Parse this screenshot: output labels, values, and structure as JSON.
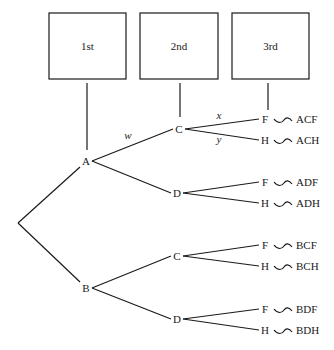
{
  "stages": [
    {
      "label": "1st",
      "x": 49,
      "y": 13,
      "w": 77,
      "h": 66,
      "lineX": 87,
      "lineY2": 150
    },
    {
      "label": "2nd",
      "x": 140,
      "y": 13,
      "w": 78,
      "h": 66,
      "lineX": 180,
      "lineY2": 117
    },
    {
      "label": "3rd",
      "x": 232,
      "y": 13,
      "w": 77,
      "h": 66,
      "lineX": 268,
      "lineY2": 110
    }
  ],
  "root": {
    "x": 18,
    "y": 223
  },
  "level1": [
    {
      "label": "A",
      "x": 86,
      "y": 161
    },
    {
      "label": "B",
      "x": 86,
      "y": 288
    }
  ],
  "level2": [
    {
      "label": "C",
      "parent": 0,
      "x": 179,
      "y": 129
    },
    {
      "label": "D",
      "parent": 0,
      "x": 177,
      "y": 193
    },
    {
      "label": "C",
      "parent": 1,
      "x": 177,
      "y": 256
    },
    {
      "label": "D",
      "parent": 1,
      "x": 177,
      "y": 319
    }
  ],
  "level3": [
    {
      "label": "F",
      "parent": 0,
      "x": 265,
      "y": 119,
      "outcome": "ACF"
    },
    {
      "label": "H",
      "parent": 0,
      "x": 265,
      "y": 140,
      "outcome": "ACH"
    },
    {
      "label": "F",
      "parent": 1,
      "x": 265,
      "y": 182,
      "outcome": "ADF"
    },
    {
      "label": "H",
      "parent": 1,
      "x": 265,
      "y": 203,
      "outcome": "ADH"
    },
    {
      "label": "F",
      "parent": 2,
      "x": 265,
      "y": 245,
      "outcome": "BCF"
    },
    {
      "label": "H",
      "parent": 2,
      "x": 265,
      "y": 266,
      "outcome": "BCH"
    },
    {
      "label": "F",
      "parent": 3,
      "x": 265,
      "y": 309,
      "outcome": "BDF"
    },
    {
      "label": "H",
      "parent": 3,
      "x": 265,
      "y": 330,
      "outcome": "BDH"
    }
  ],
  "edge_labels": [
    {
      "text": "w",
      "x": 128,
      "y": 139
    },
    {
      "text": "x",
      "x": 219,
      "y": 119
    },
    {
      "text": "y",
      "x": 219,
      "y": 143
    }
  ]
}
